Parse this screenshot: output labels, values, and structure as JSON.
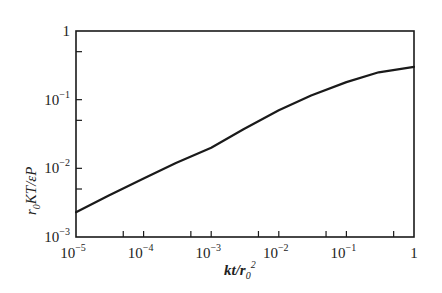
{
  "chart_data": {
    "type": "line",
    "title": "",
    "xlabel": "kt/r0^2",
    "ylabel": "r0KT/εP",
    "xscale": "log",
    "yscale": "log",
    "xlim": [
      1e-05,
      1
    ],
    "ylim": [
      0.001,
      1
    ],
    "grid": false,
    "legend": null,
    "x_ticks": [
      {
        "base": "10",
        "exp": "−5",
        "value": 1e-05
      },
      {
        "base": "10",
        "exp": "−4",
        "value": 0.0001
      },
      {
        "base": "10",
        "exp": "−3",
        "value": 0.001
      },
      {
        "base": "10",
        "exp": "−2",
        "value": 0.01
      },
      {
        "base": "10",
        "exp": "−1",
        "value": 0.1
      },
      {
        "base": "1",
        "exp": "",
        "value": 1
      }
    ],
    "y_ticks": [
      {
        "base": "10",
        "exp": "−3",
        "value": 0.001
      },
      {
        "base": "10",
        "exp": "−2",
        "value": 0.01
      },
      {
        "base": "10",
        "exp": "−1",
        "value": 0.1
      },
      {
        "base": "1",
        "exp": "",
        "value": 1
      }
    ],
    "x_minor_ticks": [
      5e-05,
      0.0005,
      0.005,
      0.05,
      0.5
    ],
    "y_minor_ticks": [
      0.005,
      0.05,
      0.5
    ],
    "series": [
      {
        "name": "r0KT/εP",
        "x": [
          1e-05,
          3e-05,
          0.0001,
          0.0003,
          0.001,
          0.003,
          0.01,
          0.03,
          0.1,
          0.3,
          1
        ],
        "y": [
          0.0023,
          0.004,
          0.0071,
          0.012,
          0.02,
          0.037,
          0.07,
          0.115,
          0.18,
          0.25,
          0.3
        ]
      }
    ]
  },
  "labels": {
    "x_axis": {
      "main": "kt/r",
      "sub": "0",
      "sup": "2"
    },
    "y_axis": {
      "pre": "r",
      "sub": "0",
      "main": "KT/εP"
    }
  }
}
